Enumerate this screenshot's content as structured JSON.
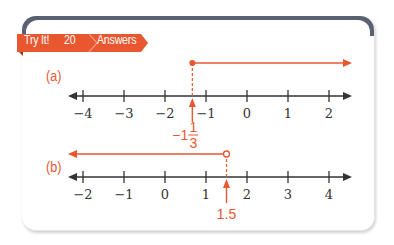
{
  "banner": {
    "title": "Try It!",
    "number": "20",
    "subtitle": "Answers"
  },
  "colors": {
    "accent": "#e8572f",
    "axis": "#333333",
    "card_header": "#5a6170"
  },
  "parts": [
    {
      "label": "(a)",
      "axis_min": -4,
      "axis_max": 2,
      "ticks": [
        "−4",
        "−3",
        "−2",
        "−1",
        "0",
        "1",
        "2"
      ],
      "boundary_value": -1.3333,
      "boundary_label_whole": "−1",
      "boundary_label_num": "1",
      "boundary_label_den": "3",
      "endpoint": "closed",
      "direction": "right"
    },
    {
      "label": "(b)",
      "axis_min": -2,
      "axis_max": 4,
      "ticks": [
        "−2",
        "−1",
        "0",
        "1",
        "2",
        "3",
        "4"
      ],
      "boundary_value": 1.5,
      "boundary_label": "1.5",
      "endpoint": "open",
      "direction": "left"
    }
  ]
}
